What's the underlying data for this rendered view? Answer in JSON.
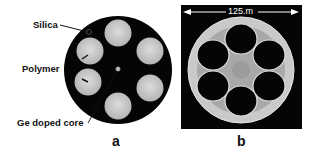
{
  "figure": {
    "panel_a": {
      "letter": "a",
      "annotations": {
        "silica": "Silica",
        "polymer": "Polymer",
        "core": "Ge doped core"
      },
      "description": "Cross-section schematic: black silica disc with six light polymer-filled holes around a small Ge-doped core"
    },
    "panel_b": {
      "letter": "b",
      "scale_label": "125.m",
      "description": "Micrograph of fiber cross-section with six air holes in a silica ring"
    },
    "colors": {
      "background": "#ffffff",
      "fiber_black": "#050505",
      "polymer_gray": "#c8c8c8",
      "silica_light": "#d0d0d0",
      "text": "#111111"
    }
  }
}
